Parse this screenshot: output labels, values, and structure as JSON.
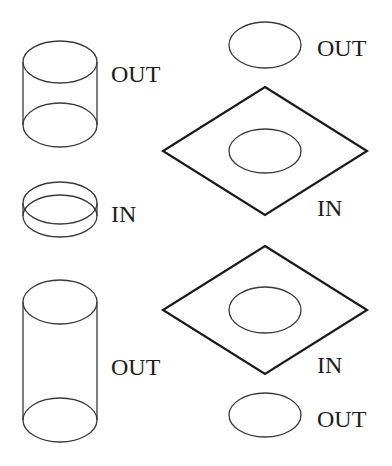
{
  "diagram": {
    "labels": {
      "cyl_top": "OUT",
      "ring": "IN",
      "cyl_tall": "OUT",
      "ellipse_top": "OUT",
      "diamond_top": "IN",
      "diamond_bottom": "IN",
      "ellipse_bottom": "OUT"
    },
    "shapes": [
      {
        "id": "cyl_top",
        "type": "cylinder",
        "label": "OUT"
      },
      {
        "id": "ring",
        "type": "short-cylinder",
        "label": "IN"
      },
      {
        "id": "cyl_tall",
        "type": "tall-cylinder",
        "label": "OUT"
      },
      {
        "id": "ellipse_top",
        "type": "ellipse",
        "label": "OUT"
      },
      {
        "id": "diamond_top",
        "type": "diamond-with-ellipse",
        "label": "IN"
      },
      {
        "id": "diamond_bottom",
        "type": "diamond-with-ellipse",
        "label": "IN"
      },
      {
        "id": "ellipse_bottom",
        "type": "ellipse",
        "label": "OUT"
      }
    ],
    "colors": {
      "background": "#ffffff",
      "stroke": "#1a1a1a"
    }
  }
}
